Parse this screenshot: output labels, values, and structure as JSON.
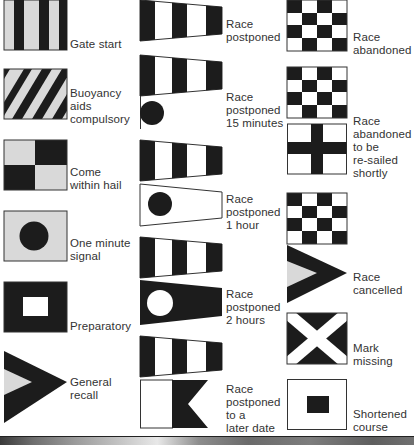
{
  "colors": {
    "flag_dark": "#1c1c1c",
    "flag_light_gray": "#d9d9d9",
    "flag_white": "#ffffff",
    "outline": "#333333",
    "text": "#333333"
  },
  "columns": [
    {
      "name": "left",
      "signals": [
        {
          "id": "gate-start",
          "lines": [
            "Gate start"
          ],
          "flag": "vertical-stripes"
        },
        {
          "id": "buoyancy-aids",
          "lines": [
            "Buoyancy",
            "aids",
            "compulsory"
          ],
          "flag": "diagonal-stripes"
        },
        {
          "id": "come-within-hail",
          "lines": [
            "Come",
            "within hail"
          ],
          "flag": "quartered"
        },
        {
          "id": "one-minute",
          "lines": [
            "One minute",
            "signal"
          ],
          "flag": "gray-with-black-circle"
        },
        {
          "id": "preparatory",
          "lines": [
            "Preparatory"
          ],
          "flag": "black-with-white-square"
        },
        {
          "id": "general-recall",
          "lines": [
            "General",
            "recall"
          ],
          "flag": "swallowtail-pennant-gray-center"
        }
      ]
    },
    {
      "name": "middle",
      "signals": [
        {
          "id": "race-postponed",
          "lines": [
            "Race",
            "postponed"
          ],
          "flag": "answering-pennant"
        },
        {
          "id": "race-postponed-15",
          "lines": [
            "Race",
            "postponed",
            "15 minutes"
          ],
          "flag": "answering-pennant-over-ball"
        },
        {
          "id": "race-postponed-1h",
          "lines": [
            "Race",
            "postponed",
            "1 hour"
          ],
          "flag": "answering-pennant-over-white-pennant-black-ball"
        },
        {
          "id": "race-postponed-2h",
          "lines": [
            "Race",
            "postponed",
            "2 hours"
          ],
          "flag": "answering-pennant-over-black-pennant-white-ball"
        },
        {
          "id": "race-postponed-later",
          "lines": [
            "Race",
            "postponed",
            "to a",
            "later date"
          ],
          "flag": "answering-pennant-over-swallowtail-A"
        }
      ]
    },
    {
      "name": "right",
      "signals": [
        {
          "id": "race-abandoned",
          "lines": [
            "Race",
            "abandoned"
          ],
          "flag": "checkered"
        },
        {
          "id": "race-abandoned-resail",
          "lines": [
            "Race",
            "abandoned",
            "to be",
            "re-sailed",
            "shortly"
          ],
          "flag": "checkered-over-cross"
        },
        {
          "id": "race-cancelled",
          "lines": [
            "Race",
            "cancelled"
          ],
          "flag": "checkered-over-swallowtail-pennant"
        },
        {
          "id": "mark-missing",
          "lines": [
            "Mark",
            "missing"
          ],
          "flag": "saltire"
        },
        {
          "id": "shortened-course",
          "lines": [
            "Shortened",
            "course"
          ],
          "flag": "white-with-black-square"
        }
      ]
    }
  ]
}
